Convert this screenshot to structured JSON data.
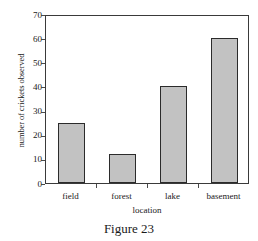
{
  "chart_data": {
    "type": "bar",
    "title": "",
    "categories": [
      "field",
      "forest",
      "lake",
      "basement"
    ],
    "values": [
      25,
      12,
      40,
      60
    ],
    "xlabel": "location",
    "ylabel": "number of crickets observed",
    "ylim": [
      0,
      70
    ],
    "yticks": [
      0,
      10,
      20,
      30,
      40,
      50,
      60,
      70
    ],
    "ytick_labels": [
      "0",
      "10",
      "20",
      "30",
      "40",
      "50",
      "60",
      "70"
    ],
    "grid": false,
    "legend": false,
    "bar_fill_color": "#c2c2c2",
    "bar_edge_color": "#2b2b2b",
    "axis_color": "#3a3a3a",
    "background_color": "#ffffff"
  },
  "caption": {
    "text": "Figure 23"
  }
}
